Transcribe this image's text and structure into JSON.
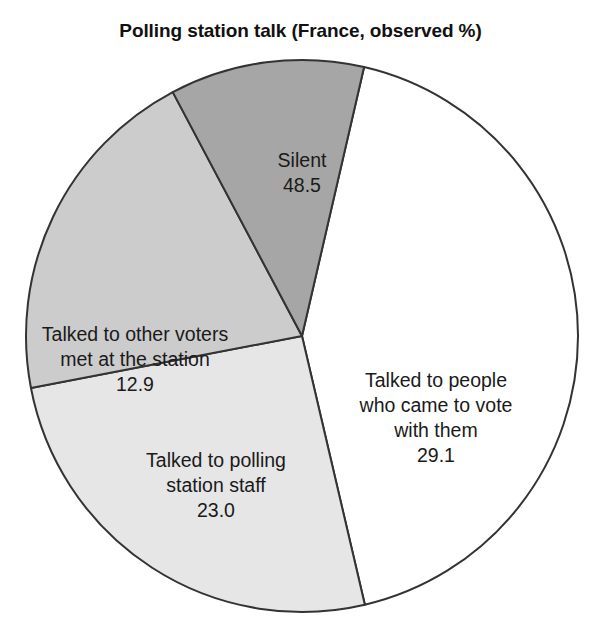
{
  "chart_data": {
    "type": "pie",
    "title": "Polling station talk (France, observed %)",
    "xlabel": "",
    "ylabel": "",
    "legend": "none",
    "grid": false,
    "note": "Multi-response percentages; slices drawn proportional to the listed values.",
    "total": 113.5,
    "start_angle_deg": -77,
    "direction": "clockwise",
    "categories": [
      "Silent",
      "Talked to people who came to vote with them",
      "Talked to polling station staff",
      "Talked to other voters met at the station"
    ],
    "values": [
      48.5,
      29.1,
      23.0,
      12.9
    ],
    "value_labels": [
      "48.5",
      "29.1",
      "23.0",
      "12.9"
    ],
    "colors": [
      "#ffffff",
      "#e6e6e6",
      "#cccccc",
      "#a6a6a6"
    ],
    "edge_color": "#333333",
    "slices": [
      {
        "name": "silent",
        "label_lines": [
          "Silent"
        ],
        "value": 48.5,
        "value_label": "48.5",
        "color": "#ffffff"
      },
      {
        "name": "came-to-vote-with-them",
        "label_lines": [
          "Talked to people",
          "who came to vote",
          "with them"
        ],
        "value": 29.1,
        "value_label": "29.1",
        "color": "#e6e6e6"
      },
      {
        "name": "polling-station-staff",
        "label_lines": [
          "Talked to polling",
          "station staff"
        ],
        "value": 23.0,
        "value_label": "23.0",
        "color": "#cccccc"
      },
      {
        "name": "other-voters-met",
        "label_lines": [
          "Talked to other voters",
          "met at the station"
        ],
        "value": 12.9,
        "value_label": "12.9",
        "color": "#a6a6a6"
      }
    ]
  },
  "labels": {
    "silent": {
      "line1": "Silent",
      "value": "48.5"
    },
    "with_them": {
      "line1": "Talked to people",
      "line2": "who came to vote",
      "line3": "with them",
      "value": "29.1"
    },
    "staff": {
      "line1": "Talked to polling",
      "line2": "station staff",
      "value": "23.0"
    },
    "other_voters": {
      "line1": "Talked to other voters",
      "line2": "met at the station",
      "value": "12.9"
    }
  },
  "geometry": {
    "center_x": 302,
    "center_y": 336,
    "radius": 276
  }
}
